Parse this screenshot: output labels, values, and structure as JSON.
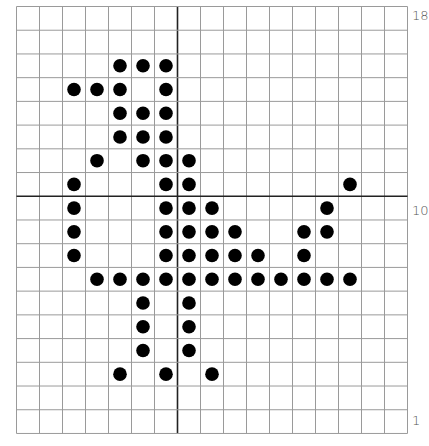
{
  "diagram": {
    "type": "dot-grid",
    "columns": 17,
    "rows": 18,
    "cell_width": 23,
    "cell_height": 23.72,
    "axis_column_line": 7,
    "axis_row_line": 8,
    "colors": {
      "grid_line": "#9a9a9a",
      "axis_line": "#222222",
      "dot": "#000000",
      "label": "#555555"
    },
    "row_labels": [
      {
        "text": "18",
        "row": 0
      },
      {
        "text": "10",
        "row": 8
      },
      {
        "text": "1",
        "row": 17
      }
    ],
    "dots": [
      [
        2,
        4
      ],
      [
        2,
        5
      ],
      [
        2,
        6
      ],
      [
        3,
        2
      ],
      [
        3,
        3
      ],
      [
        3,
        4
      ],
      [
        3,
        6
      ],
      [
        4,
        4
      ],
      [
        4,
        5
      ],
      [
        4,
        6
      ],
      [
        5,
        4
      ],
      [
        5,
        5
      ],
      [
        5,
        6
      ],
      [
        6,
        3
      ],
      [
        6,
        5
      ],
      [
        6,
        6
      ],
      [
        6,
        7
      ],
      [
        7,
        2
      ],
      [
        7,
        6
      ],
      [
        7,
        7
      ],
      [
        7,
        14
      ],
      [
        8,
        2
      ],
      [
        8,
        6
      ],
      [
        8,
        7
      ],
      [
        8,
        8
      ],
      [
        8,
        13
      ],
      [
        9,
        2
      ],
      [
        9,
        6
      ],
      [
        9,
        7
      ],
      [
        9,
        8
      ],
      [
        9,
        9
      ],
      [
        9,
        12
      ],
      [
        9,
        13
      ],
      [
        10,
        2
      ],
      [
        10,
        6
      ],
      [
        10,
        7
      ],
      [
        10,
        8
      ],
      [
        10,
        9
      ],
      [
        10,
        10
      ],
      [
        10,
        12
      ],
      [
        11,
        3
      ],
      [
        11,
        4
      ],
      [
        11,
        5
      ],
      [
        11,
        6
      ],
      [
        11,
        7
      ],
      [
        11,
        8
      ],
      [
        11,
        9
      ],
      [
        11,
        10
      ],
      [
        11,
        11
      ],
      [
        11,
        12
      ],
      [
        11,
        13
      ],
      [
        11,
        14
      ],
      [
        12,
        5
      ],
      [
        12,
        7
      ],
      [
        13,
        5
      ],
      [
        13,
        7
      ],
      [
        14,
        5
      ],
      [
        14,
        7
      ],
      [
        15,
        4
      ],
      [
        15,
        6
      ],
      [
        15,
        8
      ]
    ]
  }
}
